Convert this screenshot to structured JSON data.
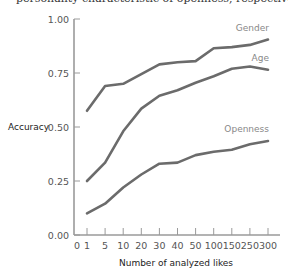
{
  "caption": "personality characteristic of openness, respectively",
  "chart_data": {
    "type": "line",
    "title": "",
    "xlabel": "Number of analyzed likes",
    "ylabel": "Accuracy",
    "ylim": [
      0.0,
      1.0
    ],
    "yticks": [
      "0.00",
      "0.25",
      "0.50",
      "0.75",
      "1.00"
    ],
    "categories": [
      "1",
      "5",
      "10",
      "20",
      "30",
      "40",
      "50",
      "100",
      "150",
      "250",
      "300"
    ],
    "x_tick_labels": [
      "0",
      "1",
      "5",
      "10",
      "20",
      "30",
      "40",
      "50",
      "100",
      "150",
      "250",
      "300"
    ],
    "grid": false,
    "legend": "inline labels at line ends",
    "series": [
      {
        "name": "Gender",
        "values": [
          0.575,
          0.69,
          0.7,
          0.745,
          0.79,
          0.8,
          0.805,
          0.865,
          0.87,
          0.88,
          0.905
        ]
      },
      {
        "name": "Age",
        "values": [
          0.25,
          0.335,
          0.48,
          0.585,
          0.645,
          0.67,
          0.705,
          0.735,
          0.77,
          0.78,
          0.765
        ]
      },
      {
        "name": "Openness",
        "values": [
          0.1,
          0.145,
          0.22,
          0.28,
          0.33,
          0.335,
          0.37,
          0.385,
          0.395,
          0.42,
          0.435
        ]
      }
    ]
  },
  "colors": {
    "line": "#6b6b6b",
    "axis": "#9a9a9a"
  }
}
